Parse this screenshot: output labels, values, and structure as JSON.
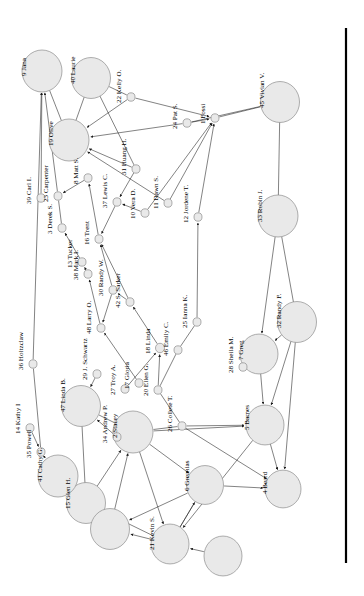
{
  "figure": {
    "type": "social-network-graph",
    "orientation": "rotated-90-ccw",
    "background": "#ffffff",
    "node_fill": "#e9e9e9",
    "node_stroke": "#8d8d8d",
    "edge_color": "#1b1b1b",
    "border_rule_color": "#000000",
    "node_count": 48,
    "edge_count": 74
  },
  "border_rule": {
    "x": 346,
    "y1": 28,
    "y2": 563
  },
  "nodes": [
    {
      "id": 1,
      "label": "1 Fossi",
      "x": 215,
      "y": 118,
      "r": 4.0,
      "lx": 205,
      "ly": 124
    },
    {
      "id": 2,
      "label": "2 Stacey",
      "x": 133,
      "y": 432,
      "r": 20.0,
      "lx": 117,
      "ly": 438
    },
    {
      "id": 3,
      "label": "3 Derek S.",
      "x": 62,
      "y": 228,
      "r": 4.0,
      "lx": 52,
      "ly": 234
    },
    {
      "id": 4,
      "label": "4 Beard",
      "x": 283,
      "y": 489,
      "r": 18.0,
      "lx": 267,
      "ly": 494
    },
    {
      "id": 5,
      "label": "5 Barnes",
      "x": 265,
      "y": 425,
      "r": 19.0,
      "lx": 249,
      "ly": 430
    },
    {
      "id": 6,
      "label": "6 Greanias",
      "x": 205,
      "y": 485,
      "r": 18.5,
      "lx": 189,
      "ly": 491
    },
    {
      "id": 7,
      "label": "7 Greg",
      "x": 259,
      "y": 354,
      "r": 19.0,
      "lx": 243,
      "ly": 360
    },
    {
      "id": 8,
      "label": "8 Matt S.",
      "x": 88,
      "y": 178,
      "r": 4.0,
      "lx": 78,
      "ly": 184
    },
    {
      "id": 9,
      "label": "9 Jana",
      "x": 42,
      "y": 71,
      "r": 20.0,
      "lx": 26,
      "ly": 76
    },
    {
      "id": 10,
      "label": "10 Vera D.",
      "x": 145,
      "y": 213,
      "r": 4.0,
      "lx": 135,
      "ly": 219
    },
    {
      "id": 11,
      "label": "11 Dawn S.",
      "x": 168,
      "y": 203,
      "r": 4.0,
      "lx": 158,
      "ly": 209
    },
    {
      "id": 12,
      "label": "12 Jordene T.",
      "x": 198,
      "y": 217,
      "r": 4.0,
      "lx": 188,
      "ly": 223
    },
    {
      "id": 13,
      "label": "13 Tucker",
      "x": 82,
      "y": 262,
      "r": 4.0,
      "lx": 72,
      "ly": 268
    },
    {
      "id": 14,
      "label": "14 Kathy I",
      "x": 30,
      "y": 428,
      "r": 4.0,
      "lx": 20,
      "ly": 434
    },
    {
      "id": 15,
      "label": "15 Glen H.",
      "x": 86,
      "y": 503,
      "r": 19.5,
      "lx": 70,
      "ly": 509
    },
    {
      "id": 16,
      "label": "16 Trent",
      "x": 99,
      "y": 239,
      "r": 4.0,
      "lx": 89,
      "ly": 245
    },
    {
      "id": 17,
      "label": "17 Gloria",
      "x": 139,
      "y": 383,
      "r": 4.0,
      "lx": 129,
      "ly": 389
    },
    {
      "id": 18,
      "label": "18 Linda",
      "x": 160,
      "y": 348,
      "r": 4.5,
      "lx": 150,
      "ly": 354
    },
    {
      "id": 19,
      "label": "19 Olive",
      "x": 69,
      "y": 140,
      "r": 20.0,
      "lx": 53,
      "ly": 146
    },
    {
      "id": 20,
      "label": "20 Ellen G.",
      "x": 158,
      "y": 390,
      "r": 4.0,
      "lx": 148,
      "ly": 396
    },
    {
      "id": 21,
      "label": "21 Kevin S.",
      "x": 170,
      "y": 544,
      "r": 19.0,
      "lx": 154,
      "ly": 550
    },
    {
      "id": 22,
      "label": "22 Kelly O.",
      "x": 131,
      "y": 97,
      "r": 4.0,
      "lx": 121,
      "ly": 103
    },
    {
      "id": 23,
      "label": "23 Carpenter",
      "x": 58,
      "y": 196,
      "r": 4.0,
      "lx": 48,
      "ly": 202
    },
    {
      "id": 24,
      "label": "24 Pat S.",
      "x": 187,
      "y": 123,
      "r": 4.0,
      "lx": 177,
      "ly": 129
    },
    {
      "id": 25,
      "label": "25 Ianna K.",
      "x": 197,
      "y": 322,
      "r": 4.0,
      "lx": 187,
      "ly": 328
    },
    {
      "id": 26,
      "label": "26 Collete T.",
      "x": 182,
      "y": 426,
      "r": 4.0,
      "lx": 172,
      "ly": 432
    },
    {
      "id": 27,
      "label": "27 Troy A.",
      "x": 125,
      "y": 389,
      "r": 4.0,
      "lx": 115,
      "ly": 395
    },
    {
      "id": 28,
      "label": "28 Sheila M.",
      "x": 243,
      "y": 367,
      "r": 4.0,
      "lx": 233,
      "ly": 373
    },
    {
      "id": 29,
      "label": "29 J. Schwartz",
      "x": 97,
      "y": 374,
      "r": 4.0,
      "lx": 87,
      "ly": 380
    },
    {
      "id": 30,
      "label": "30 Randy W.",
      "x": 113,
      "y": 290,
      "r": 4.0,
      "lx": 103,
      "ly": 296
    },
    {
      "id": 31,
      "label": "31 Huang H.",
      "x": 136,
      "y": 169,
      "r": 4.0,
      "lx": 126,
      "ly": 175
    },
    {
      "id": 32,
      "label": "32 Randy F.",
      "x": 297,
      "y": 322,
      "r": 19.5,
      "lx": 281,
      "ly": 328
    },
    {
      "id": 33,
      "label": "33 Robin J.",
      "x": 278,
      "y": 216,
      "r": 20.0,
      "lx": 262,
      "ly": 222
    },
    {
      "id": 34,
      "label": "34 Andrew P.",
      "x": 117,
      "y": 437,
      "r": 4.0,
      "lx": 107,
      "ly": 443
    },
    {
      "id": 35,
      "label": "35 Powell",
      "x": 41,
      "y": 452,
      "r": 4.0,
      "lx": 31,
      "ly": 458
    },
    {
      "id": 36,
      "label": "36 Holtzclaw",
      "x": 33,
      "y": 364,
      "r": 4.0,
      "lx": 23,
      "ly": 370
    },
    {
      "id": 37,
      "label": "37 Lewis C.",
      "x": 117,
      "y": 202,
      "r": 4.0,
      "lx": 107,
      "ly": 208
    },
    {
      "id": 38,
      "label": "38 Mark I.",
      "x": 88,
      "y": 274,
      "r": 4.0,
      "lx": 78,
      "ly": 280
    },
    {
      "id": 39,
      "label": "39 Carl I.",
      "x": 41,
      "y": 198,
      "r": 4.0,
      "lx": 31,
      "ly": 204
    },
    {
      "id": 40,
      "label": "40 Laurie",
      "x": 91,
      "y": 78,
      "r": 19.5,
      "lx": 75,
      "ly": 84
    },
    {
      "id": 41,
      "label": "41 Cathy G.",
      "x": 58,
      "y": 476,
      "r": 20.0,
      "lx": 42,
      "ly": 482
    },
    {
      "id": 42,
      "label": "42 S. Sarker",
      "x": 130,
      "y": 302,
      "r": 4.0,
      "lx": 120,
      "ly": 308
    },
    {
      "id": 43,
      "label": "43",
      "x": 110,
      "y": 529,
      "r": 19.5,
      "lx": 95,
      "ly": 535
    },
    {
      "id": 44,
      "label": "44",
      "x": 223,
      "y": 556,
      "r": 19.0,
      "lx": 208,
      "ly": 562
    },
    {
      "id": 45,
      "label": "45 Vivian V.",
      "x": 280,
      "y": 102,
      "r": 19.5,
      "lx": 264,
      "ly": 108
    },
    {
      "id": 46,
      "label": "46 Emily C.",
      "x": 178,
      "y": 350,
      "r": 4.0,
      "lx": 168,
      "ly": 356
    },
    {
      "id": 47,
      "label": "47 Linda B.",
      "x": 81,
      "y": 406,
      "r": 19.5,
      "lx": 65,
      "ly": 412
    },
    {
      "id": 48,
      "label": "48 Larry O.",
      "x": 101,
      "y": 328,
      "r": 4.0,
      "lx": 91,
      "ly": 334
    }
  ],
  "edges": [
    {
      "from": 23,
      "to": 9,
      "arrow": true
    },
    {
      "from": 39,
      "to": 9,
      "arrow": true
    },
    {
      "from": 36,
      "to": 9,
      "arrow": true
    },
    {
      "from": 40,
      "to": 19,
      "arrow": false
    },
    {
      "from": 22,
      "to": 19,
      "arrow": true
    },
    {
      "from": 31,
      "to": 19,
      "arrow": true
    },
    {
      "from": 24,
      "to": 19,
      "arrow": true
    },
    {
      "from": 11,
      "to": 19,
      "arrow": true
    },
    {
      "from": 40,
      "to": 31,
      "arrow": false
    },
    {
      "from": 22,
      "to": 1,
      "arrow": true
    },
    {
      "from": 45,
      "to": 1,
      "arrow": false
    },
    {
      "from": 24,
      "to": 1,
      "arrow": true
    },
    {
      "from": 12,
      "to": 1,
      "arrow": true
    },
    {
      "from": 10,
      "to": 1,
      "arrow": true
    },
    {
      "from": 11,
      "to": 1,
      "arrow": true
    },
    {
      "from": 45,
      "to": 33,
      "arrow": false
    },
    {
      "from": 33,
      "to": 32,
      "arrow": false
    },
    {
      "from": 8,
      "to": 23,
      "arrow": true
    },
    {
      "from": 16,
      "to": 8,
      "arrow": true
    },
    {
      "from": 37,
      "to": 16,
      "arrow": true
    },
    {
      "from": 3,
      "to": 23,
      "arrow": false
    },
    {
      "from": 13,
      "to": 3,
      "arrow": true
    },
    {
      "from": 38,
      "to": 13,
      "arrow": true
    },
    {
      "from": 30,
      "to": 16,
      "arrow": true
    },
    {
      "from": 42,
      "to": 16,
      "arrow": true
    },
    {
      "from": 10,
      "to": 37,
      "arrow": true
    },
    {
      "from": 31,
      "to": 37,
      "arrow": true
    },
    {
      "from": 48,
      "to": 38,
      "arrow": true
    },
    {
      "from": 30,
      "to": 48,
      "arrow": true
    },
    {
      "from": 42,
      "to": 30,
      "arrow": true
    },
    {
      "from": 18,
      "to": 42,
      "arrow": true
    },
    {
      "from": 17,
      "to": 48,
      "arrow": true
    },
    {
      "from": 27,
      "to": 18,
      "arrow": true
    },
    {
      "from": 20,
      "to": 18,
      "arrow": true
    },
    {
      "from": 46,
      "to": 20,
      "arrow": false
    },
    {
      "from": 25,
      "to": 12,
      "arrow": true
    },
    {
      "from": 46,
      "to": 25,
      "arrow": false
    },
    {
      "from": 26,
      "to": 20,
      "arrow": false
    },
    {
      "from": 28,
      "to": 7,
      "arrow": true
    },
    {
      "from": 32,
      "to": 7,
      "arrow": true
    },
    {
      "from": 33,
      "to": 7,
      "arrow": true
    },
    {
      "from": 29,
      "to": 47,
      "arrow": true
    },
    {
      "from": 34,
      "to": 47,
      "arrow": true
    },
    {
      "from": 14,
      "to": 35,
      "arrow": true
    },
    {
      "from": 36,
      "to": 35,
      "arrow": false
    },
    {
      "from": 35,
      "to": 41,
      "arrow": true
    },
    {
      "from": 47,
      "to": 15,
      "arrow": false
    },
    {
      "from": 2,
      "to": 34,
      "arrow": true
    },
    {
      "from": 2,
      "to": 26,
      "arrow": false
    },
    {
      "from": 2,
      "to": 5,
      "arrow": true
    },
    {
      "from": 2,
      "to": 6,
      "arrow": true
    },
    {
      "from": 5,
      "to": 4,
      "arrow": true
    },
    {
      "from": 32,
      "to": 5,
      "arrow": true
    },
    {
      "from": 32,
      "to": 4,
      "arrow": true
    },
    {
      "from": 7,
      "to": 5,
      "arrow": true
    },
    {
      "from": 6,
      "to": 4,
      "arrow": true
    },
    {
      "from": 6,
      "to": 43,
      "arrow": true
    },
    {
      "from": 21,
      "to": 6,
      "arrow": true
    },
    {
      "from": 21,
      "to": 15,
      "arrow": true
    },
    {
      "from": 21,
      "to": 43,
      "arrow": true
    },
    {
      "from": 15,
      "to": 43,
      "arrow": true
    },
    {
      "from": 41,
      "to": 15,
      "arrow": true
    },
    {
      "from": 44,
      "to": 21,
      "arrow": true
    },
    {
      "from": 5,
      "to": 21,
      "arrow": true
    },
    {
      "from": 6,
      "to": 21,
      "arrow": false
    },
    {
      "from": 2,
      "to": 21,
      "arrow": true
    },
    {
      "from": 47,
      "to": 2,
      "arrow": false
    },
    {
      "from": 26,
      "to": 5,
      "arrow": true
    },
    {
      "from": 26,
      "to": 4,
      "arrow": true
    },
    {
      "from": 15,
      "to": 2,
      "arrow": true
    },
    {
      "from": 43,
      "to": 2,
      "arrow": true
    },
    {
      "from": 9,
      "to": 19,
      "arrow": false
    },
    {
      "from": 40,
      "to": 22,
      "arrow": false
    },
    {
      "from": 45,
      "to": 24,
      "arrow": false
    }
  ]
}
